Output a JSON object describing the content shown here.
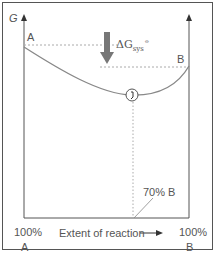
{
  "diagram": {
    "y_axis_label": "G",
    "curve_start_label": "A",
    "curve_end_label": "B",
    "delta_g_label": {
      "symbol": "ΔG",
      "subscript": "sys",
      "superscript": "⦵"
    },
    "equilibrium_label": "70% B",
    "x_axis_label": "Extent of reaction",
    "x_axis_left": {
      "percent": "100%",
      "species": "A"
    },
    "x_axis_right": {
      "percent": "100%",
      "species": "B"
    },
    "colors": {
      "curve": "#888888",
      "axis": "#555555",
      "arrow": "#777777",
      "dashed": "#aaaaaa"
    },
    "equilibrium_fraction": 0.7
  }
}
